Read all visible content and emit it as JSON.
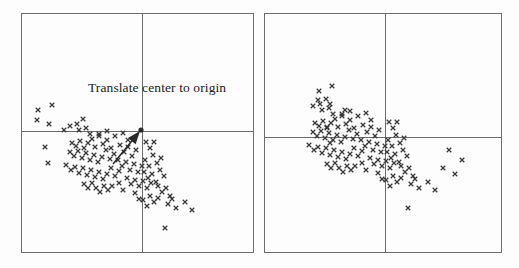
{
  "figure": {
    "width": 519,
    "height": 268,
    "background_color": "#fdfdfd",
    "line_color": "#6d6d6d",
    "marker_color": "#3a3a3a",
    "text_color": "#1a1a1a",
    "annotation_label": "Translate center to origin"
  },
  "chart_data": {
    "type": "scatter",
    "title": "",
    "xlabel": "",
    "ylabel": "",
    "grid": false,
    "legend": null,
    "marker": "x",
    "panels": [
      {
        "name": "before-translation",
        "frame": {
          "x": 21,
          "y": 13,
          "width": 233,
          "height": 240
        },
        "axes": {
          "origin_x": 141,
          "origin_y": 130
        },
        "annotation": {
          "text": "Translate center to origin",
          "x": 88,
          "y": 92
        },
        "arrow": {
          "from_x": 113,
          "from_y": 164,
          "to_x": 140,
          "to_y": 131,
          "head_dot": true
        },
        "points": [
          [
            38,
            110
          ],
          [
            52,
            105
          ],
          [
            37,
            120
          ],
          [
            49,
            124
          ],
          [
            64,
            130
          ],
          [
            45,
            147
          ],
          [
            48,
            163
          ],
          [
            70,
            126
          ],
          [
            77,
            124
          ],
          [
            79,
            130
          ],
          [
            83,
            119
          ],
          [
            86,
            128
          ],
          [
            90,
            134
          ],
          [
            72,
            143
          ],
          [
            76,
            146
          ],
          [
            80,
            141
          ],
          [
            84,
            148
          ],
          [
            88,
            143
          ],
          [
            92,
            139
          ],
          [
            95,
            147
          ],
          [
            99,
            136
          ],
          [
            103,
            144
          ],
          [
            107,
            140
          ],
          [
            111,
            148
          ],
          [
            70,
            152
          ],
          [
            74,
            156
          ],
          [
            78,
            151
          ],
          [
            82,
            158
          ],
          [
            86,
            153
          ],
          [
            90,
            160
          ],
          [
            94,
            155
          ],
          [
            98,
            162
          ],
          [
            102,
            157
          ],
          [
            106,
            150
          ],
          [
            110,
            159
          ],
          [
            114,
            154
          ],
          [
            66,
            165
          ],
          [
            71,
            170
          ],
          [
            75,
            167
          ],
          [
            79,
            173
          ],
          [
            83,
            168
          ],
          [
            87,
            175
          ],
          [
            91,
            170
          ],
          [
            95,
            177
          ],
          [
            99,
            172
          ],
          [
            103,
            179
          ],
          [
            107,
            174
          ],
          [
            111,
            168
          ],
          [
            115,
            176
          ],
          [
            119,
            171
          ],
          [
            99,
            134
          ],
          [
            107,
            131
          ],
          [
            115,
            136
          ],
          [
            123,
            133
          ],
          [
            128,
            140
          ],
          [
            120,
            145
          ],
          [
            124,
            152
          ],
          [
            128,
            147
          ],
          [
            132,
            156
          ],
          [
            136,
            150
          ],
          [
            118,
            160
          ],
          [
            122,
            166
          ],
          [
            126,
            162
          ],
          [
            130,
            170
          ],
          [
            134,
            164
          ],
          [
            138,
            172
          ],
          [
            142,
            166
          ],
          [
            127,
            178
          ],
          [
            131,
            184
          ],
          [
            135,
            180
          ],
          [
            139,
            186
          ],
          [
            143,
            181
          ],
          [
            147,
            188
          ],
          [
            151,
            183
          ],
          [
            144,
            172
          ],
          [
            148,
            178
          ],
          [
            152,
            174
          ],
          [
            156,
            182
          ],
          [
            145,
            160
          ],
          [
            149,
            166
          ],
          [
            153,
            155
          ],
          [
            157,
            163
          ],
          [
            161,
            158
          ],
          [
            160,
            170
          ],
          [
            164,
            176
          ],
          [
            158,
            186
          ],
          [
            162,
            192
          ],
          [
            166,
            188
          ],
          [
            170,
            196
          ],
          [
            150,
            196
          ],
          [
            154,
            202
          ],
          [
            158,
            198
          ],
          [
            143,
            200
          ],
          [
            147,
            206
          ],
          [
            168,
            204
          ],
          [
            172,
            199
          ],
          [
            176,
            208
          ],
          [
            185,
            202
          ],
          [
            192,
            210
          ],
          [
            165,
            228
          ],
          [
            135,
            193
          ],
          [
            139,
            199
          ],
          [
            123,
            190
          ],
          [
            119,
            183
          ],
          [
            112,
            186
          ],
          [
            108,
            190
          ],
          [
            104,
            186
          ],
          [
            100,
            192
          ],
          [
            96,
            188
          ],
          [
            92,
            183
          ],
          [
            88,
            188
          ],
          [
            84,
            184
          ],
          [
            150,
            148
          ],
          [
            154,
            142
          ],
          [
            146,
            142
          ]
        ]
      },
      {
        "name": "after-translation",
        "frame": {
          "x": 264,
          "y": 13,
          "width": 238,
          "height": 240
        },
        "axes": {
          "origin_x": 384,
          "origin_y": 136
        },
        "annotation": null,
        "arrow": null,
        "points": [
          [
            319,
            91
          ],
          [
            332,
            86
          ],
          [
            318,
            100
          ],
          [
            330,
            104
          ],
          [
            345,
            110
          ],
          [
            327,
            127
          ],
          [
            330,
            143
          ],
          [
            313,
            106
          ],
          [
            320,
            104
          ],
          [
            322,
            110
          ],
          [
            326,
            99
          ],
          [
            329,
            108
          ],
          [
            333,
            114
          ],
          [
            315,
            123
          ],
          [
            319,
            126
          ],
          [
            323,
            121
          ],
          [
            327,
            128
          ],
          [
            331,
            123
          ],
          [
            335,
            119
          ],
          [
            338,
            127
          ],
          [
            342,
            116
          ],
          [
            346,
            124
          ],
          [
            350,
            120
          ],
          [
            354,
            128
          ],
          [
            313,
            132
          ],
          [
            317,
            136
          ],
          [
            321,
            131
          ],
          [
            325,
            138
          ],
          [
            329,
            133
          ],
          [
            333,
            140
          ],
          [
            337,
            135
          ],
          [
            341,
            142
          ],
          [
            345,
            137
          ],
          [
            349,
            130
          ],
          [
            353,
            139
          ],
          [
            357,
            134
          ],
          [
            309,
            145
          ],
          [
            314,
            150
          ],
          [
            318,
            147
          ],
          [
            322,
            153
          ],
          [
            326,
            148
          ],
          [
            330,
            155
          ],
          [
            334,
            150
          ],
          [
            338,
            157
          ],
          [
            342,
            152
          ],
          [
            346,
            159
          ],
          [
            350,
            154
          ],
          [
            354,
            148
          ],
          [
            358,
            156
          ],
          [
            362,
            151
          ],
          [
            342,
            114
          ],
          [
            350,
            111
          ],
          [
            358,
            116
          ],
          [
            366,
            113
          ],
          [
            371,
            120
          ],
          [
            363,
            125
          ],
          [
            367,
            132
          ],
          [
            371,
            127
          ],
          [
            375,
            136
          ],
          [
            379,
            130
          ],
          [
            361,
            140
          ],
          [
            365,
            146
          ],
          [
            369,
            142
          ],
          [
            373,
            150
          ],
          [
            377,
            144
          ],
          [
            381,
            152
          ],
          [
            385,
            146
          ],
          [
            370,
            158
          ],
          [
            374,
            164
          ],
          [
            378,
            160
          ],
          [
            382,
            166
          ],
          [
            386,
            161
          ],
          [
            390,
            168
          ],
          [
            394,
            163
          ],
          [
            387,
            152
          ],
          [
            391,
            158
          ],
          [
            395,
            154
          ],
          [
            399,
            162
          ],
          [
            388,
            140
          ],
          [
            392,
            146
          ],
          [
            396,
            135
          ],
          [
            400,
            143
          ],
          [
            404,
            138
          ],
          [
            403,
            150
          ],
          [
            407,
            156
          ],
          [
            401,
            166
          ],
          [
            405,
            172
          ],
          [
            409,
            168
          ],
          [
            413,
            176
          ],
          [
            393,
            176
          ],
          [
            397,
            182
          ],
          [
            401,
            178
          ],
          [
            386,
            180
          ],
          [
            390,
            186
          ],
          [
            411,
            184
          ],
          [
            415,
            179
          ],
          [
            419,
            188
          ],
          [
            428,
            182
          ],
          [
            435,
            190
          ],
          [
            408,
            208
          ],
          [
            378,
            173
          ],
          [
            382,
            179
          ],
          [
            366,
            170
          ],
          [
            362,
            163
          ],
          [
            355,
            166
          ],
          [
            351,
            170
          ],
          [
            347,
            166
          ],
          [
            343,
            172
          ],
          [
            339,
            168
          ],
          [
            335,
            163
          ],
          [
            331,
            168
          ],
          [
            327,
            164
          ],
          [
            393,
            128
          ],
          [
            397,
            122
          ],
          [
            389,
            122
          ],
          [
            443,
            168
          ],
          [
            455,
            174
          ],
          [
            462,
            160
          ],
          [
            449,
            150
          ]
        ]
      }
    ]
  }
}
